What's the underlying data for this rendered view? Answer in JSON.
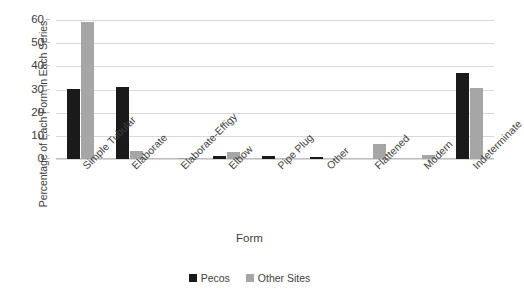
{
  "chart_data": {
    "type": "bar",
    "title": "",
    "xlabel": "Form",
    "ylabel": "Percentage of Each Form in Each Series",
    "ylim": [
      0,
      60
    ],
    "yticks": [
      60,
      50,
      40,
      30,
      20,
      10,
      0
    ],
    "grid": true,
    "legend_position": "bottom",
    "categories": [
      "Simple Tubular",
      "Elaborate",
      "Elaborate-Effigy",
      "Elbow",
      "Pipe Plug",
      "Other",
      "Flattened",
      "Modern",
      "Indeterminate"
    ],
    "series": [
      {
        "name": "Pecos",
        "color": "#1a1a1a",
        "values": [
          30.3,
          31.2,
          0,
          1.2,
          1.5,
          0.9,
          0,
          0,
          37.2
        ]
      },
      {
        "name": "Other Sites",
        "color": "#a6a6a6",
        "values": [
          59.0,
          3.4,
          0.3,
          3.2,
          0,
          0,
          6.5,
          1.8,
          30.8
        ]
      }
    ]
  },
  "axes": {
    "y_title": "Percentage of Each Form in Each Series",
    "x_title": "Form"
  },
  "legend": {
    "items": [
      {
        "label": "Pecos",
        "swatch": "legend-swatch-black"
      },
      {
        "label": "Other Sites",
        "swatch": "legend-swatch-gray"
      }
    ]
  },
  "colors": {
    "pecos": "#1a1a1a",
    "other_sites": "#a6a6a6",
    "gridline": "#d9d9d9",
    "text": "#3f3f3f",
    "background": "#ffffff"
  }
}
